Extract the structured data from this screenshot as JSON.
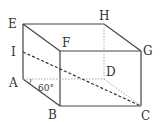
{
  "figure": {
    "type": "cuboid",
    "vertices": {
      "A": {
        "label": "A",
        "x": 23,
        "y": 79
      },
      "B": {
        "label": "B",
        "x": 60,
        "y": 106
      },
      "C": {
        "label": "C",
        "x": 141,
        "y": 106
      },
      "D": {
        "label": "D",
        "x": 104,
        "y": 79
      },
      "E": {
        "label": "E",
        "x": 23,
        "y": 24
      },
      "F": {
        "label": "F",
        "x": 60,
        "y": 51
      },
      "G": {
        "label": "G",
        "x": 141,
        "y": 51
      },
      "H": {
        "label": "H",
        "x": 104,
        "y": 24
      },
      "I": {
        "label": "I",
        "x": 23,
        "y": 52
      }
    },
    "angle_label": "60°",
    "colors": {
      "solid_edge": "#444444",
      "hidden_edge": "#aaaaaa",
      "dashed_segment": "#333333",
      "text": "#333333"
    }
  }
}
